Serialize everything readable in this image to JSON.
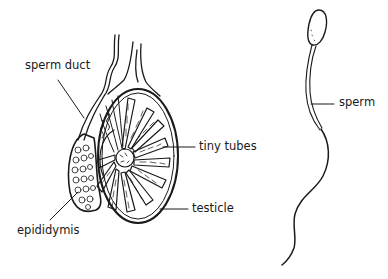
{
  "diagram": {
    "panels": [
      {
        "id": "testis-cross-section",
        "labels": [
          {
            "text": "sperm duct",
            "x": 25,
            "y": 66
          },
          {
            "text": "tiny tubes",
            "x": 199,
            "y": 143
          },
          {
            "text": "testicle",
            "x": 192,
            "y": 204
          },
          {
            "text": "epididymis",
            "x": 17,
            "y": 231
          }
        ]
      },
      {
        "id": "sperm-cell",
        "labels": [
          {
            "text": "sperm",
            "x": 339,
            "y": 96
          }
        ]
      }
    ],
    "colors": {
      "ink": "#1a1a1a",
      "background": "#ffffff"
    }
  }
}
